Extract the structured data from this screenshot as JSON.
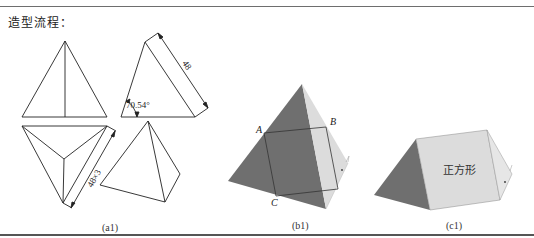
{
  "header": {
    "title": "造型流程："
  },
  "figures": {
    "a1": {
      "caption": "(a1)",
      "side_dimension": "48",
      "angle_label": "70.54°",
      "top_dimension": "48×3"
    },
    "b1": {
      "caption": "(b1)",
      "points": [
        "A",
        "B",
        "C"
      ]
    },
    "c1": {
      "caption": "(c1)",
      "face_label": "正方形"
    }
  },
  "colors": {
    "dark_face": "#6f6f6f",
    "light_face": "#dcdcdc",
    "line": "#222222",
    "rule": "#6e6e6e"
  }
}
